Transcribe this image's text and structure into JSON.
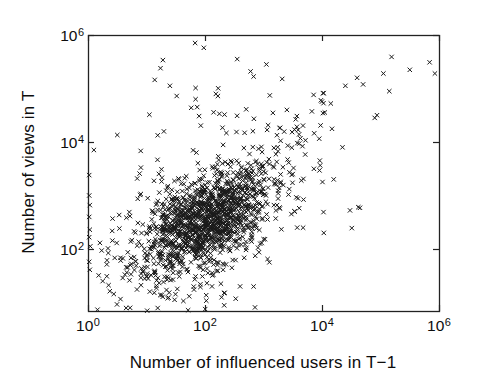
{
  "chart_data": {
    "type": "scatter",
    "title": "",
    "xlabel": "Number of influenced users in T−1",
    "ylabel": "Number of views in T",
    "xscale": "log",
    "yscale": "log",
    "xlim": [
      1,
      1000000
    ],
    "ylim": [
      7,
      1000000
    ],
    "ylim_log10": [
      0.84,
      6
    ],
    "xtick_exponents": [
      0,
      2,
      4,
      6
    ],
    "ytick_exponents": [
      2,
      4,
      6
    ],
    "tick_base": "10",
    "grid": false,
    "box": true,
    "tick_direction": "in",
    "legend": null,
    "marker": "x",
    "marker_color": "#1a1a1a",
    "marker_size_px": 4.4,
    "axis_color": "#222222",
    "seed": 1337,
    "n_points_total_estimate": 1590,
    "clusters": [
      {
        "name": "dense-core",
        "n": 1040,
        "mu_x": 2.02,
        "sigma_x": 0.52,
        "x_range": [
          0.25,
          4.6
        ],
        "y_intercept": 1.62,
        "y_slope": 0.45,
        "sigma_y": 0.4
      },
      {
        "name": "halo",
        "n": 430,
        "mu_x": 1.95,
        "sigma_x": 0.85,
        "x_range": [
          0.08,
          5.0
        ],
        "y_intercept": 1.5,
        "y_slope": 0.47,
        "sigma_y": 0.72
      },
      {
        "name": "upper-right-arm",
        "n": 55,
        "mu_x": 3.45,
        "sigma_x": 0.5,
        "x_range": [
          2.6,
          5.0
        ],
        "y_intercept": 0.95,
        "y_slope": 0.88,
        "sigma_y": 0.42
      },
      {
        "name": "top-band",
        "n": 20,
        "mu_x": 2.35,
        "sigma_x": 0.75,
        "x_range": [
          1.0,
          4.2
        ],
        "y_intercept": 4.65,
        "y_slope": 0.0,
        "sigma_y": 0.33
      }
    ],
    "outliers_log10": [
      [
        1.83,
        5.85
      ],
      [
        1.98,
        5.76
      ],
      [
        1.28,
        5.53
      ],
      [
        1.24,
        5.38
      ],
      [
        1.14,
        5.16
      ],
      [
        1.84,
        5.01
      ],
      [
        2.22,
        4.86
      ],
      [
        1.05,
        4.51
      ],
      [
        0.5,
        4.13
      ],
      [
        0.1,
        3.85
      ],
      [
        2.55,
        5.55
      ],
      [
        2.78,
        5.32
      ],
      [
        3.05,
        5.45
      ],
      [
        3.32,
        5.18
      ],
      [
        5.19,
        5.59
      ],
      [
        5.5,
        5.35
      ],
      [
        5.84,
        5.49
      ],
      [
        5.93,
        5.28
      ],
      [
        5.05,
        5.28
      ],
      [
        4.6,
        5.2
      ],
      [
        5.15,
        4.95
      ],
      [
        4.4,
        5.05
      ],
      [
        4.9,
        4.45
      ],
      [
        4.15,
        4.72
      ],
      [
        4.94,
        4.5
      ],
      [
        4.65,
        2.77
      ],
      [
        4.51,
        2.39
      ],
      [
        4.2,
        3.3
      ],
      [
        4.35,
        3.9
      ],
      [
        4.62,
        2.78
      ],
      [
        4.03,
        2.3
      ],
      [
        0.79,
        1.85
      ],
      [
        0.97,
        1.83
      ],
      [
        0.97,
        1.66
      ],
      [
        1.14,
        1.57
      ],
      [
        1.31,
        1.48
      ],
      [
        1.17,
        1.27
      ],
      [
        1.26,
        1.14
      ],
      [
        1.36,
        1.08
      ],
      [
        1.57,
        1.76
      ],
      [
        1.71,
        1.57
      ],
      [
        2.05,
        1.55
      ],
      [
        2.31,
        1.61
      ],
      [
        0.72,
        0.9
      ],
      [
        2.6,
        1.3
      ],
      [
        3.1,
        1.75
      ]
    ],
    "left_edge_points_log10": [
      [
        0.02,
        3.38
      ],
      [
        0.02,
        3.0
      ],
      [
        0.03,
        2.82
      ],
      [
        0.02,
        2.6
      ],
      [
        0.03,
        2.36
      ],
      [
        0.02,
        2.22
      ],
      [
        0.04,
        2.05
      ],
      [
        0.02,
        1.76
      ],
      [
        0.03,
        1.61
      ]
    ],
    "layout": {
      "canvas": {
        "width": 480,
        "height": 391
      },
      "plot_box": {
        "left": 88,
        "top": 35,
        "right": 439,
        "bottom": 311
      },
      "x_tick_label_top": 317,
      "y_tick_label_right": 84,
      "xlabel_center": {
        "x": 263,
        "y": 363
      },
      "ylabel_center": {
        "x": 29,
        "y": 172
      },
      "tick_length": 6
    }
  }
}
